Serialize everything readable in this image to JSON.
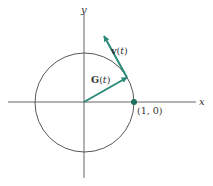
{
  "figure": {
    "axes": {
      "x_label": "x",
      "y_label": "y"
    },
    "circle": {
      "description": "unit circle"
    },
    "vectors": [
      {
        "name": "G(t)",
        "bold_part": "G",
        "rest": "(",
        "italic": "t",
        "close": ")"
      },
      {
        "name": "v(t)",
        "bold_part": "v",
        "rest": "(",
        "italic": "t",
        "close": ")"
      }
    ],
    "point": {
      "label": "(1, 0)"
    },
    "colors": {
      "vector": "#2a8a78",
      "line": "#444444",
      "point": "#1f6e5e"
    }
  }
}
